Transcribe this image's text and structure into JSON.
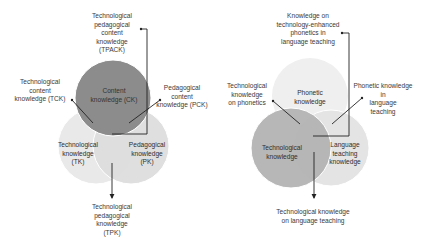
{
  "diagrams": [
    {
      "name": "TPACK framework",
      "circles": [
        {
          "id": "ck",
          "label": "Content\nknowledge (CK)",
          "color": "#8c8c8c"
        },
        {
          "id": "tk",
          "label": "Technological\nknowledge\n(TK)",
          "color": "#e9e9e9"
        },
        {
          "id": "pk",
          "label": "Pedagogical\nknowledge\n(PK)",
          "color": "#dcdcdc"
        }
      ],
      "callouts": {
        "tpack": "Technological\npedagogical\ncontent\nknowledge\n(TPACK)",
        "tck": "Technological\ncontent\nknowledge (TCK)",
        "pck": "Pedagogical\ncontent\nknowledge (PCK)",
        "tpk": "Technological\npedagogical\nknowledge\n(TPK)"
      }
    },
    {
      "name": "Phonetics adaptation",
      "circles": [
        {
          "id": "phonetic",
          "label": "Phonetic\nknowledge",
          "color": "#efefef"
        },
        {
          "id": "tech",
          "label": "Technological\nknowledge",
          "color": "#b3b3b3"
        },
        {
          "id": "lang",
          "label": "Language\nteaching\nknowledge",
          "color": "#e4e4e4"
        }
      ],
      "callouts": {
        "center": "Knowledge on\ntechnology-enhanced\nphonetics in\nlanguage teaching",
        "tech_phonetics": "Technological\nknowledge\non phonetics",
        "phonetic_lang": "Phonetic knowledge\nin\nlanguage\nteaching",
        "tech_lang": "Technological knowledge\non language teaching"
      }
    }
  ]
}
